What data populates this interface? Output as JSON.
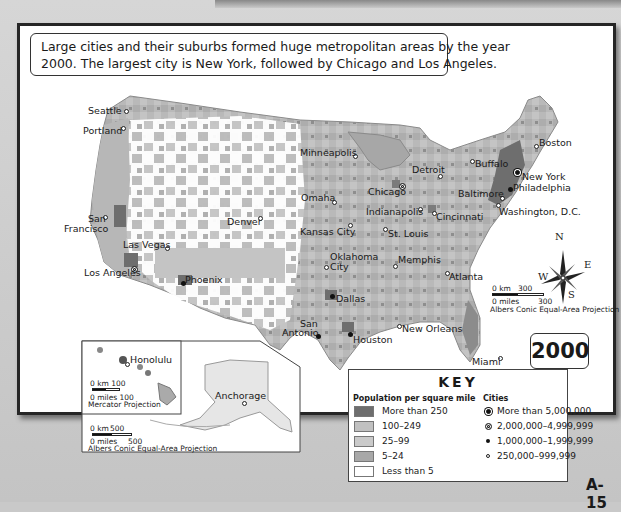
{
  "caption": {
    "line1": "Large cities and their suburbs formed huge metropolitan areas by the year",
    "line2": "2000. The largest city is New York, followed by Chicago and Los Angeles."
  },
  "year_label": "2000",
  "page_number": "A-15",
  "colors": {
    "more_than_250": "#6e6e6e",
    "c100_249": "#b4b4b4",
    "c25_99": "#c2c2c2",
    "c5_24": "#a8a8a8",
    "less_than_5": "#ffffff",
    "frame": "#262626",
    "page_bg": "#c9c9c9"
  },
  "cities": [
    {
      "name": "Seattle",
      "size": "250,000-999,999"
    },
    {
      "name": "Portland",
      "size": "250,000-999,999"
    },
    {
      "name": "San Francisco",
      "size": "250,000-999,999"
    },
    {
      "name": "Las Vegas",
      "size": "250,000-999,999"
    },
    {
      "name": "Los Angeles",
      "size": "2,000,000-4,999,999"
    },
    {
      "name": "Phoenix",
      "size": "1,000,000-1,999,999"
    },
    {
      "name": "Denver",
      "size": "250,000-999,999"
    },
    {
      "name": "Minneapolis",
      "size": "250,000-999,999"
    },
    {
      "name": "Omaha",
      "size": "250,000-999,999"
    },
    {
      "name": "Kansas City",
      "size": "250,000-999,999"
    },
    {
      "name": "Oklahoma City",
      "size": "250,000-999,999"
    },
    {
      "name": "Chicago",
      "size": "2,000,000-4,999,999"
    },
    {
      "name": "Detroit",
      "size": "250,000-999,999"
    },
    {
      "name": "Indianapolis",
      "size": "250,000-999,999"
    },
    {
      "name": "St. Louis",
      "size": "250,000-999,999"
    },
    {
      "name": "Cincinnati",
      "size": "250,000-999,999"
    },
    {
      "name": "Memphis",
      "size": "250,000-999,999"
    },
    {
      "name": "Atlanta",
      "size": "250,000-999,999"
    },
    {
      "name": "Dallas",
      "size": "1,000,000-1,999,999"
    },
    {
      "name": "San Antonio",
      "size": "1,000,000-1,999,999"
    },
    {
      "name": "Houston",
      "size": "1,000,000-1,999,999"
    },
    {
      "name": "New Orleans",
      "size": "250,000-999,999"
    },
    {
      "name": "Miami",
      "size": "250,000-999,999"
    },
    {
      "name": "Buffalo",
      "size": "250,000-999,999"
    },
    {
      "name": "Boston",
      "size": "250,000-999,999"
    },
    {
      "name": "New York",
      "size": "More than 5,000,000"
    },
    {
      "name": "Philadelphia",
      "size": "1,000,000-1,999,999"
    },
    {
      "name": "Baltimore",
      "size": "250,000-999,999"
    },
    {
      "name": "Washington, D.C.",
      "size": "250,000-999,999"
    },
    {
      "name": "Honolulu",
      "size": "250,000-999,999"
    },
    {
      "name": "Anchorage",
      "size": "250,000-999,999"
    }
  ],
  "labels": {
    "seattle": "Seattle",
    "portland": "Portland",
    "san": "San",
    "francisco": "Francisco",
    "las_vegas": "Las Vegas",
    "los_angeles": "Los Angeles",
    "phoenix": "Phoenix",
    "denver": "Denver",
    "minneapolis": "Minneapolis",
    "omaha": "Omaha",
    "kansas_city": "Kansas City",
    "oklahoma": "Oklahoma",
    "city": "City",
    "chicago": "Chicago",
    "detroit": "Detroit",
    "indianapolis": "Indianapolis",
    "st_louis": "St. Louis",
    "cincinnati": "Cincinnati",
    "memphis": "Memphis",
    "atlanta": "Atlanta",
    "dallas": "Dallas",
    "san2": "San",
    "antonio": "Antonio",
    "houston": "Houston",
    "new_orleans": "New Orleans",
    "miami": "Miami",
    "buffalo": "Buffalo",
    "boston": "Boston",
    "new_york": "New York",
    "philadelphia": "Philadelphia",
    "baltimore": "Baltimore",
    "washington": "Washington, D.C.",
    "honolulu": "Honolulu",
    "anchorage": "Anchorage"
  },
  "compass": {
    "n": "N",
    "s": "S",
    "e": "E",
    "w": "W"
  },
  "scales": {
    "main": {
      "km": "0 km",
      "km_val": "300",
      "mi": "0 miles",
      "mi_val": "300",
      "projection": "Albers Conic Equal-Area Projection"
    },
    "hawaii": {
      "km": "0 km 100",
      "mi": "0 miles 100",
      "projection": "Mercator Projection"
    },
    "alaska": {
      "km": "0 km",
      "km_val": "500",
      "mi": "0 miles",
      "mi_val": "500",
      "projection": "Albers Conic Equal-Area Projection"
    }
  },
  "legend": {
    "title": "KEY",
    "population_header": "Population per square mile",
    "population": [
      "More than 250",
      "100–249",
      "25–99",
      "5–24",
      "Less than 5"
    ],
    "cities_header": "Cities",
    "cities": [
      "More than 5,000,000",
      "2,000,000–4,999,999",
      "1,000,000–1,999,999",
      "250,000–999,999"
    ]
  }
}
